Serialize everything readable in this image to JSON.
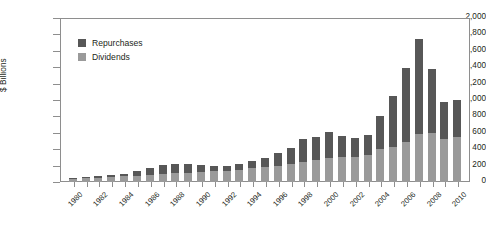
{
  "chart_data": {
    "type": "bar",
    "subtype": "stacked-column",
    "title": "",
    "xlabel": "",
    "ylabel": "$ Billions",
    "ylim": [
      0,
      2000
    ],
    "yticks": [
      0,
      200,
      400,
      600,
      800,
      1000,
      1200,
      1400,
      1600,
      1800,
      2000
    ],
    "ytick_labels": [
      "0",
      "200",
      "400",
      "600",
      "800",
      "1,000",
      "1,200",
      "1,400",
      "1,600",
      "1,800",
      "2,000"
    ],
    "grid": false,
    "legend_position": "upper-left-inside",
    "categories": [
      "1980",
      "1981",
      "1982",
      "1983",
      "1984",
      "1985",
      "1986",
      "1987",
      "1988",
      "1989",
      "1990",
      "1991",
      "1992",
      "1993",
      "1994",
      "1995",
      "1996",
      "1997",
      "1998",
      "1999",
      "2000",
      "2001",
      "2002",
      "2003",
      "2004",
      "2005",
      "2006",
      "2007",
      "2008",
      "2009",
      "2010"
    ],
    "xtick_labels": [
      "1980",
      "1982",
      "1984",
      "1986",
      "1988",
      "1990",
      "1992",
      "1994",
      "1996",
      "1998",
      "2000",
      "2002",
      "2004",
      "2006",
      "2008",
      "2010"
    ],
    "xtick_every": 2,
    "series": [
      {
        "name": "Dividends",
        "color": "#9a9a9a",
        "values": [
          45,
          50,
          55,
          62,
          68,
          75,
          85,
          95,
          105,
          115,
          125,
          130,
          140,
          150,
          165,
          180,
          200,
          220,
          245,
          265,
          290,
          300,
          310,
          330,
          400,
          430,
          490,
          580,
          600,
          520,
          545
        ]
      },
      {
        "name": "Repurchases",
        "color": "#575757",
        "values": [
          10,
          12,
          15,
          18,
          35,
          60,
          80,
          110,
          115,
          105,
          80,
          60,
          55,
          65,
          90,
          110,
          160,
          200,
          280,
          290,
          320,
          260,
          230,
          240,
          400,
          620,
          900,
          1170,
          780,
          460,
          455
        ]
      }
    ],
    "totals": [
      55,
      62,
      70,
      80,
      103,
      135,
      165,
      205,
      220,
      220,
      205,
      190,
      195,
      215,
      255,
      290,
      360,
      420,
      525,
      555,
      610,
      560,
      540,
      570,
      800,
      1050,
      1390,
      1750,
      1380,
      980,
      1000
    ]
  },
  "legend": {
    "items": [
      {
        "label": "Repurchases",
        "color": "#575757"
      },
      {
        "label": "Dividends",
        "color": "#9a9a9a"
      }
    ]
  }
}
